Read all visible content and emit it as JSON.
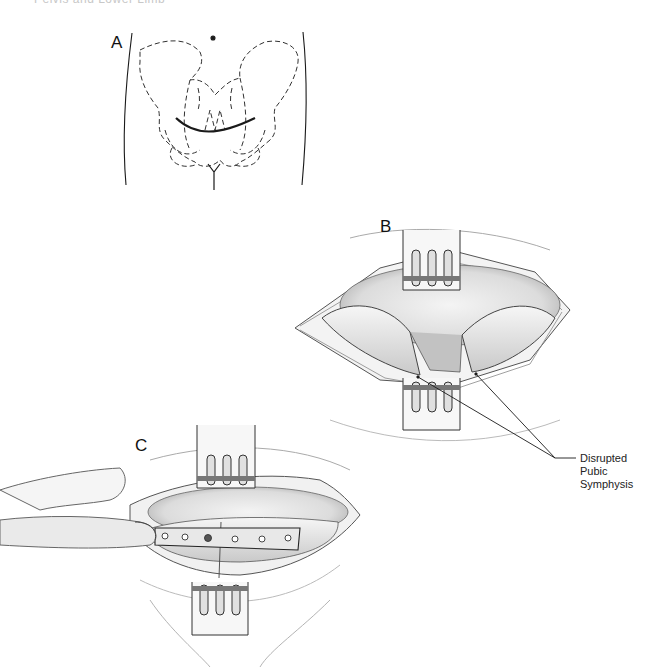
{
  "page": {
    "header_partial": {
      "page_number": "",
      "running_title": "Pelvis and Lower Limb"
    }
  },
  "figure": {
    "panels": [
      {
        "id": "A",
        "label": "A",
        "description": "Anterior view of pelvis outline with Pfannenstiel incision line"
      },
      {
        "id": "B",
        "label": "B",
        "description": "Surgical exposure with retractors showing disrupted pubic symphysis"
      },
      {
        "id": "C",
        "label": "C",
        "description": "Plate fixation across pubic symphysis held by finger, retractors in place"
      }
    ],
    "callouts": [
      {
        "text_lines": [
          "Disrupted",
          "Pubic",
          "Symphysis"
        ]
      }
    ],
    "colors": {
      "ink": "#1a1a1a",
      "shade": "#9a9a9a",
      "light_shade": "#d9d9d9",
      "background": "#ffffff"
    }
  }
}
